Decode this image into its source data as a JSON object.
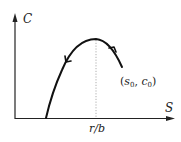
{
  "diagram": {
    "type": "phase-plane",
    "axes": {
      "x_label": "S",
      "y_label": "C"
    },
    "annotations": {
      "peak_tick_label": "r/b",
      "start_point_label_var1": "s",
      "start_point_label_sub1": "0",
      "start_point_label_var2": "c",
      "start_point_label_sub2": "0",
      "start_point_open": "(",
      "start_point_sep": ", ",
      "start_point_close": ")"
    },
    "trajectory": {
      "description": "parabolic trajectory starting at (s0, c0), rising to max at S = r/b, then decreasing to C = 0",
      "direction": "right-to-left",
      "stroke_color": "#111111"
    },
    "guide_line": {
      "style": "dotted",
      "at": "r/b",
      "color": "#999999"
    },
    "axis_color": "#222222"
  }
}
